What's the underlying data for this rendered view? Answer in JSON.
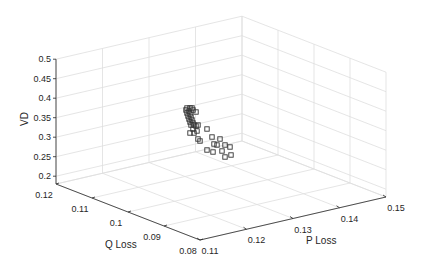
{
  "chart_data": {
    "type": "scatter",
    "dimensions": 3,
    "title": "",
    "xlabel": "P Loss",
    "ylabel": "Q Loss",
    "zlabel": "VD",
    "xlim": [
      0.11,
      0.15
    ],
    "ylim": [
      0.08,
      0.12
    ],
    "zlim": [
      0.18,
      0.5
    ],
    "x_ticks": [
      0.11,
      0.12,
      0.13,
      0.14,
      0.15
    ],
    "x_tick_labels": [
      "0.11",
      "0.12",
      "0.13",
      "0.14",
      "0.15"
    ],
    "y_ticks": [
      0.08,
      0.09,
      0.1,
      0.11,
      0.12
    ],
    "y_tick_labels": [
      "0.08",
      "0.09",
      "0.1",
      "0.11",
      "0.12"
    ],
    "z_ticks": [
      0.2,
      0.25,
      0.3,
      0.35,
      0.4,
      0.45,
      0.5
    ],
    "z_tick_labels": [
      "0.2",
      "0.25",
      "0.3",
      "0.35",
      "0.4",
      "0.45",
      "0.5"
    ],
    "grid": true,
    "legend": null,
    "marker": "square",
    "marker_color": "#333333",
    "series": [
      {
        "name": "Solutions",
        "points_screen": [
          [
            187,
            108
          ],
          [
            190,
            108
          ],
          [
            192,
            108
          ],
          [
            186,
            110
          ],
          [
            189,
            111
          ],
          [
            193,
            110
          ],
          [
            196,
            112
          ],
          [
            187,
            113
          ],
          [
            190,
            114
          ],
          [
            188,
            116
          ],
          [
            191,
            117
          ],
          [
            189,
            119
          ],
          [
            192,
            120
          ],
          [
            190,
            122
          ],
          [
            193,
            123
          ],
          [
            191,
            125
          ],
          [
            194,
            125
          ],
          [
            196,
            126
          ],
          [
            198,
            125
          ],
          [
            193,
            129
          ],
          [
            197,
            131
          ],
          [
            190,
            133
          ],
          [
            194,
            133
          ],
          [
            207,
            129
          ],
          [
            198,
            139
          ],
          [
            200,
            141
          ],
          [
            212,
            137
          ],
          [
            220,
            139
          ],
          [
            214,
            144
          ],
          [
            217,
            145
          ],
          [
            225,
            145
          ],
          [
            230,
            147
          ],
          [
            207,
            150
          ],
          [
            213,
            152
          ],
          [
            222,
            151
          ],
          [
            231,
            155
          ],
          [
            225,
            157
          ]
        ]
      }
    ]
  }
}
